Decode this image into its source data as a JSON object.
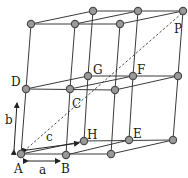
{
  "diagram": {
    "labels": {
      "A": "A",
      "B": "B",
      "C": "C",
      "D": "D",
      "E": "E",
      "F": "F",
      "G": "G",
      "H": "H",
      "P": "P",
      "a": "a",
      "b": "b",
      "c": "c"
    },
    "node_color": "#9a9a9a",
    "edge_color": "#3a3a3a",
    "nodes": {
      "A": [
        21,
        154
      ],
      "B": [
        66,
        155
      ],
      "B2": [
        111,
        154
      ],
      "H": [
        84,
        141
      ],
      "E": [
        129,
        140
      ],
      "E2": [
        173,
        140
      ],
      "D": [
        26,
        89
      ],
      "C": [
        70,
        89
      ],
      "C2": [
        115,
        90
      ],
      "G": [
        88,
        76
      ],
      "F": [
        133,
        76
      ],
      "F2": [
        178,
        76
      ],
      "T1": [
        31,
        24
      ],
      "T2": [
        75,
        24
      ],
      "T3": [
        120,
        24
      ],
      "T4": [
        93,
        11
      ],
      "T5": [
        138,
        11
      ],
      "P": [
        183,
        11
      ]
    }
  }
}
